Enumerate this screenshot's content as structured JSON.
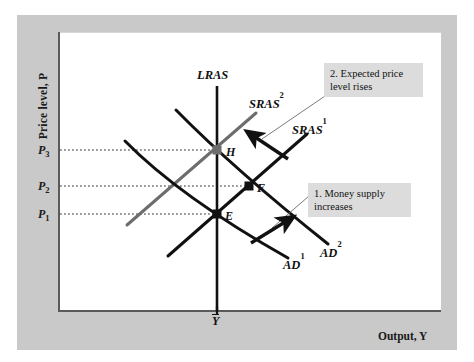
{
  "figure": {
    "domain": "diagram",
    "kind": "macroeconomics AD-AS diagram",
    "background_color": "#c9c9c9",
    "plot_background": "#ffffff"
  },
  "axes": {
    "y_label": "Price level, P",
    "x_label": "Output, Y",
    "x_potential_label": "Y",
    "y_ticks": [
      {
        "label": "P",
        "sub": "3",
        "y_px": 150
      },
      {
        "label": "P",
        "sub": "2",
        "y_px": 186
      },
      {
        "label": "P",
        "sub": "1",
        "y_px": 214
      }
    ]
  },
  "curves": [
    {
      "name": "LRAS",
      "label": "LRAS",
      "sup": "",
      "color": "#111111",
      "type": "vertical-long-run-aggregate-supply"
    },
    {
      "name": "SRAS2",
      "label": "SRAS",
      "sup": "2",
      "color": "#6a6a6a",
      "type": "short-run-aggregate-supply"
    },
    {
      "name": "SRAS1",
      "label": "SRAS",
      "sup": "1",
      "color": "#111111",
      "type": "short-run-aggregate-supply"
    },
    {
      "name": "AD1",
      "label": "AD",
      "sup": "1",
      "color": "#111111",
      "type": "aggregate-demand"
    },
    {
      "name": "AD2",
      "label": "AD",
      "sup": "2",
      "color": "#111111",
      "type": "aggregate-demand"
    }
  ],
  "points": [
    {
      "label": "E",
      "x_px": 217,
      "y_px": 214
    },
    {
      "label": "F",
      "x_px": 249,
      "y_px": 186
    },
    {
      "label": "H",
      "x_px": 217,
      "y_px": 150
    }
  ],
  "annotations": [
    {
      "id": "money-supply",
      "text": "1. Money supply\n    increases",
      "box_color": "#dcdcdc"
    },
    {
      "id": "expected-price",
      "text": "2. Expected price\n    level rises",
      "box_color": "#dcdcdc"
    }
  ],
  "arrows": [
    {
      "id": "ad-shift-arrow",
      "direction": "up-right",
      "meaning": "AD1 shifts right to AD2"
    },
    {
      "id": "sras-shift-arrow",
      "direction": "up-left",
      "meaning": "SRAS1 shifts left to SRAS2"
    }
  ]
}
